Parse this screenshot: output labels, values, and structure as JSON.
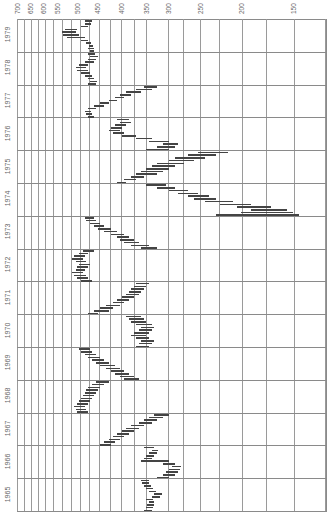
{
  "chart_data": {
    "type": "bar",
    "subtype": "horizontal-range (high-low) bars, rotated chart",
    "title": "",
    "xlabel": "",
    "ylabel": "",
    "x_axis": {
      "scale": "log",
      "reversed": true,
      "range": [
        700,
        140
      ],
      "tick_labels": [
        "700",
        "650",
        "600",
        "550",
        "500",
        "450",
        "400",
        "350",
        "300",
        "250",
        "200",
        "150"
      ],
      "tick_values": [
        700,
        650,
        600,
        550,
        500,
        450,
        400,
        350,
        300,
        250,
        200,
        150
      ]
    },
    "y_axis": {
      "categories": [
        "1979",
        "1978",
        "1977",
        "1976",
        "1975",
        "1974",
        "1973",
        "1972",
        "1971",
        "1970",
        "1969",
        "1968",
        "1967",
        "1966",
        "1965"
      ],
      "order": "top-to-bottom"
    },
    "grid": true,
    "legend": null,
    "series": [
      {
        "year": "1979",
        "ranges": [
          [
            465,
            455
          ],
          [
            470,
            455
          ],
          [
            468,
            458
          ],
          [
            475,
            462
          ],
          [
            490,
            470
          ],
          [
            530,
            480
          ],
          [
            540,
            495
          ],
          [
            545,
            505
          ],
          [
            535,
            500
          ],
          [
            490,
            470
          ],
          [
            480,
            462
          ],
          [
            478,
            460
          ]
        ]
      },
      {
        "year": "1978",
        "ranges": [
          [
            470,
            450
          ],
          [
            465,
            448
          ],
          [
            472,
            455
          ],
          [
            480,
            460
          ],
          [
            490,
            465
          ],
          [
            500,
            470
          ],
          [
            505,
            475
          ],
          [
            495,
            470
          ],
          [
            480,
            455
          ],
          [
            470,
            450
          ],
          [
            465,
            445
          ],
          [
            470,
            452
          ]
        ]
      },
      {
        "year": "1977",
        "ranges": [
          [
            470,
            455
          ],
          [
            475,
            460
          ],
          [
            478,
            462
          ],
          [
            470,
            450
          ],
          [
            455,
            430
          ],
          [
            440,
            420
          ],
          [
            420,
            400
          ],
          [
            405,
            385
          ],
          [
            395,
            370
          ],
          [
            380,
            350
          ],
          [
            360,
            330
          ],
          [
            345,
            320
          ]
        ]
      },
      {
        "year": "1976",
        "ranges": [
          [
            340,
            300
          ],
          [
            320,
            290
          ],
          [
            310,
            285
          ],
          [
            335,
            300
          ],
          [
            360,
            330
          ],
          [
            390,
            360
          ],
          [
            410,
            385
          ],
          [
            420,
            395
          ],
          [
            415,
            390
          ],
          [
            405,
            380
          ],
          [
            395,
            370
          ],
          [
            400,
            375
          ]
        ]
      },
      {
        "year": "1975",
        "ranges": [
          [
            400,
            380
          ],
          [
            385,
            360
          ],
          [
            370,
            345
          ],
          [
            360,
            320
          ],
          [
            350,
            310
          ],
          [
            340,
            300
          ],
          [
            330,
            290
          ],
          [
            320,
            275
          ],
          [
            300,
            260
          ],
          [
            290,
            245
          ],
          [
            270,
            230
          ],
          [
            255,
            215
          ]
        ]
      },
      {
        "year": "1974",
        "ranges": [
          [
            230,
            145
          ],
          [
            200,
            150
          ],
          [
            190,
            155
          ],
          [
            205,
            170
          ],
          [
            225,
            190
          ],
          [
            245,
            210
          ],
          [
            260,
            230
          ],
          [
            270,
            240
          ],
          [
            285,
            255
          ],
          [
            300,
            270
          ],
          [
            320,
            290
          ],
          [
            340,
            305
          ]
        ]
      },
      {
        "year": "1973",
        "ranges": [
          [
            350,
            320
          ],
          [
            370,
            335
          ],
          [
            385,
            355
          ],
          [
            395,
            365
          ],
          [
            400,
            375
          ],
          [
            415,
            385
          ],
          [
            430,
            400
          ],
          [
            445,
            415
          ],
          [
            455,
            430
          ],
          [
            465,
            440
          ],
          [
            475,
            450
          ],
          [
            480,
            455
          ]
        ]
      },
      {
        "year": "1972",
        "ranges": [
          [
            490,
            460
          ],
          [
            500,
            470
          ],
          [
            510,
            475
          ],
          [
            515,
            485
          ],
          [
            505,
            480
          ],
          [
            500,
            470
          ],
          [
            495,
            465
          ],
          [
            505,
            475
          ],
          [
            515,
            485
          ],
          [
            510,
            480
          ],
          [
            495,
            470
          ],
          [
            485,
            455
          ]
        ]
      },
      {
        "year": "1971",
        "ranges": [
          [
            470,
            445
          ],
          [
            455,
            420
          ],
          [
            440,
            410
          ],
          [
            425,
            395
          ],
          [
            410,
            385
          ],
          [
            400,
            375
          ],
          [
            390,
            365
          ],
          [
            380,
            355
          ],
          [
            375,
            350
          ],
          [
            370,
            345
          ],
          [
            365,
            340
          ],
          [
            360,
            335
          ]
        ]
      },
      {
        "year": "1970",
        "ranges": [
          [
            360,
            335
          ],
          [
            355,
            330
          ],
          [
            350,
            325
          ],
          [
            360,
            335
          ],
          [
            370,
            340
          ],
          [
            365,
            335
          ],
          [
            355,
            330
          ],
          [
            350,
            325
          ],
          [
            360,
            330
          ],
          [
            370,
            340
          ],
          [
            375,
            345
          ],
          [
            380,
            350
          ]
        ]
      },
      {
        "year": "1969",
        "ranges": [
          [
            385,
            355
          ],
          [
            395,
            365
          ],
          [
            405,
            375
          ],
          [
            415,
            385
          ],
          [
            425,
            395
          ],
          [
            440,
            405
          ],
          [
            450,
            420
          ],
          [
            460,
            430
          ],
          [
            470,
            440
          ],
          [
            480,
            450
          ],
          [
            490,
            460
          ],
          [
            495,
            465
          ]
        ]
      },
      {
        "year": "1968",
        "ranges": [
          [
            500,
            470
          ],
          [
            505,
            475
          ],
          [
            510,
            480
          ],
          [
            500,
            470
          ],
          [
            495,
            465
          ],
          [
            490,
            460
          ],
          [
            485,
            455
          ],
          [
            480,
            450
          ],
          [
            475,
            445
          ],
          [
            470,
            440
          ],
          [
            460,
            430
          ],
          [
            450,
            420
          ]
        ]
      },
      {
        "year": "1967",
        "ranges": [
          [
            440,
            415
          ],
          [
            430,
            405
          ],
          [
            420,
            395
          ],
          [
            410,
            385
          ],
          [
            400,
            375
          ],
          [
            390,
            365
          ],
          [
            380,
            355
          ],
          [
            370,
            345
          ],
          [
            355,
            330
          ],
          [
            345,
            320
          ],
          [
            335,
            310
          ],
          [
            325,
            300
          ]
        ]
      },
      {
        "year": "1966",
        "ranges": [
          [
            320,
            300
          ],
          [
            310,
            290
          ],
          [
            305,
            285
          ],
          [
            300,
            282
          ],
          [
            295,
            280
          ],
          [
            310,
            290
          ],
          [
            350,
            300
          ],
          [
            345,
            330
          ],
          [
            340,
            325
          ],
          [
            335,
            320
          ],
          [
            330,
            318
          ],
          [
            345,
            325
          ]
        ]
      },
      {
        "year": "1965",
        "ranges": [
          [
            345,
            330
          ],
          [
            340,
            328
          ],
          [
            338,
            326
          ],
          [
            335,
            325
          ],
          [
            340,
            328
          ],
          [
            330,
            315
          ],
          [
            325,
            312
          ],
          [
            335,
            322
          ],
          [
            340,
            328
          ],
          [
            345,
            332
          ],
          [
            348,
            335
          ],
          [
            350,
            336
          ]
        ]
      }
    ]
  },
  "layout": {
    "plot_left": 17,
    "plot_right": 326,
    "plot_top": 19,
    "plot_bottom": 511,
    "x_at_700": 17,
    "x_at_150": 293,
    "vertical_grid_x": [
      17,
      24,
      31,
      38,
      45,
      53,
      62,
      71,
      80,
      89,
      99,
      110,
      121,
      134,
      146,
      168,
      183,
      200,
      219,
      242,
      266,
      294,
      325
    ],
    "tick_label_x": [
      17,
      30,
      43,
      57,
      77,
      97,
      121,
      146,
      168,
      200,
      241,
      293
    ]
  },
  "colors": {
    "background": "#ffffff",
    "grid": "#8a8a8a",
    "bars": "#444444",
    "labels": "#666666"
  }
}
